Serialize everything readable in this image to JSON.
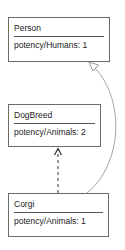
{
  "diagram": {
    "nodes": [
      {
        "id": "person",
        "title": "Person",
        "attribute": "potency/Humans: 1"
      },
      {
        "id": "dogbreed",
        "title": "DogBreed",
        "attribute": "potency/Animals: 2"
      },
      {
        "id": "corgi",
        "title": "Corgi",
        "attribute": "potency/Animals: 1"
      }
    ],
    "edges": [
      {
        "from": "corgi",
        "to": "dogbreed",
        "style": "dashed",
        "arrow": "open"
      },
      {
        "from": "corgi",
        "to": "person",
        "style": "solid-curved",
        "arrow": "hollow-triangle"
      }
    ],
    "colors": {
      "border": "#6b6b6b",
      "text": "#222222",
      "edge": "#888888"
    }
  }
}
